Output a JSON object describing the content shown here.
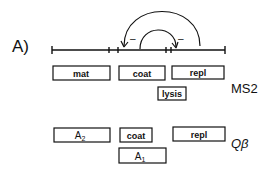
{
  "panel_label": "A)",
  "ms2": {
    "label": "MS2",
    "genes": [
      {
        "name": "mat",
        "x": 53,
        "y": 66,
        "w": 57,
        "h": 14
      },
      {
        "name": "coat",
        "x": 119,
        "y": 66,
        "w": 46,
        "h": 14
      },
      {
        "name": "repl",
        "x": 172,
        "y": 66,
        "w": 52,
        "h": 13
      },
      {
        "name": "lysis",
        "x": 158,
        "y": 87,
        "w": 28,
        "h": 13
      }
    ],
    "arc_signs": [
      "–",
      "–"
    ]
  },
  "qbeta": {
    "label": "Qβ",
    "genes": [
      {
        "name": "A",
        "sub": "2",
        "x": 54,
        "y": 128,
        "w": 56,
        "h": 14
      },
      {
        "name": "coat",
        "x": 120,
        "y": 128,
        "w": 32,
        "h": 14
      },
      {
        "name": "repl",
        "x": 173,
        "y": 127,
        "w": 52,
        "h": 14
      },
      {
        "name": "A",
        "sub": "1",
        "x": 119,
        "y": 148,
        "w": 47,
        "h": 15
      }
    ]
  }
}
